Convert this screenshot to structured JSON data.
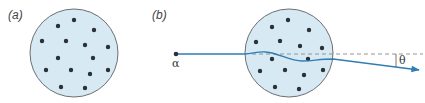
{
  "panels": [
    {
      "id": "a",
      "label": "(a)",
      "circle": {
        "cx": 74,
        "cy": 53,
        "r": 44
      },
      "dots": [
        [
          74,
          20
        ],
        [
          58,
          26
        ],
        [
          94,
          30
        ],
        [
          42,
          41
        ],
        [
          66,
          41
        ],
        [
          85,
          45
        ],
        [
          108,
          47
        ],
        [
          58,
          58
        ],
        [
          93,
          58
        ],
        [
          46,
          70
        ],
        [
          71,
          70
        ],
        [
          90,
          74
        ],
        [
          108,
          70
        ],
        [
          61,
          87
        ],
        [
          85,
          88
        ]
      ]
    },
    {
      "id": "b",
      "label": "(b)",
      "circle": {
        "cx": 289,
        "cy": 53,
        "r": 44
      },
      "dots": [
        [
          288,
          20
        ],
        [
          272,
          27
        ],
        [
          309,
          30
        ],
        [
          256,
          42
        ],
        [
          280,
          41
        ],
        [
          300,
          46
        ],
        [
          322,
          48
        ],
        [
          272,
          59
        ],
        [
          308,
          59
        ],
        [
          260,
          71
        ],
        [
          285,
          70
        ],
        [
          304,
          75
        ],
        [
          323,
          70
        ],
        [
          275,
          87
        ],
        [
          299,
          89
        ]
      ],
      "particle": {
        "symbol": "α",
        "x": 176,
        "y": 54
      },
      "deflection": {
        "symbol": "θ"
      }
    }
  ],
  "colors": {
    "circle_fill": "#d7eaf3",
    "circle_stroke": "#6b6f73",
    "dot": "#2b303a",
    "trajectory": "#2f7db3",
    "reference_dash": "#8a8a8a",
    "label": "#444444"
  }
}
